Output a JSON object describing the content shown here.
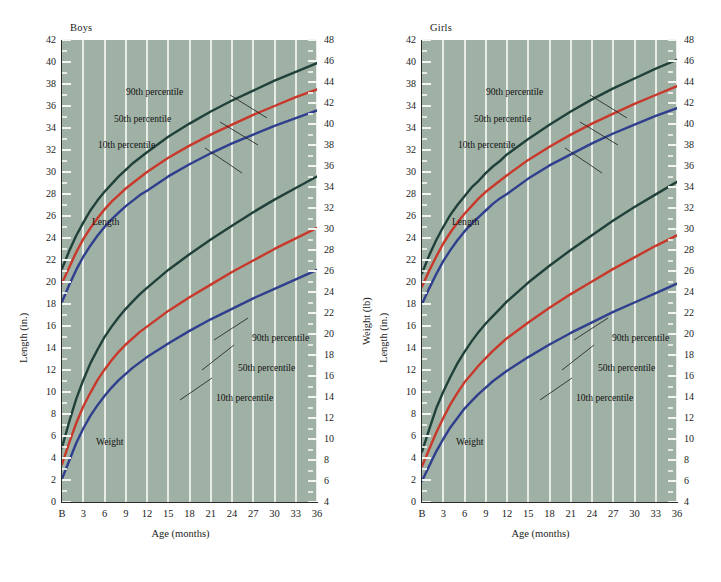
{
  "figure": {
    "background_color": "#ffffff",
    "plot_background_color": "#9fb0a4",
    "gridline_color": "#eef1ed"
  },
  "series_colors": {
    "p90": "#20413a",
    "p50": "#c8392c",
    "p10": "#2f3f8e"
  },
  "panels": [
    {
      "id": "boys",
      "title": "Boys",
      "x_axis": {
        "label": "Age (months)",
        "ticks": [
          "B",
          "3",
          "6",
          "9",
          "12",
          "15",
          "18",
          "21",
          "24",
          "27",
          "30",
          "33",
          "36"
        ],
        "values": [
          0,
          3,
          6,
          9,
          12,
          15,
          18,
          21,
          24,
          27,
          30,
          33,
          36
        ],
        "range": [
          0,
          36
        ]
      },
      "y_left": {
        "label": "Length (in.)",
        "range": [
          0,
          42
        ],
        "step": 2,
        "ticks": [
          "0",
          "2",
          "4",
          "6",
          "8",
          "10",
          "12",
          "14",
          "16",
          "18",
          "20",
          "22",
          "24",
          "26",
          "28",
          "30",
          "32",
          "34",
          "36",
          "38",
          "40",
          "42"
        ]
      },
      "y_right": {
        "label": "Weight (lb)",
        "range": [
          4,
          48
        ],
        "step": 2,
        "ticks": [
          "4",
          "6",
          "8",
          "10",
          "12",
          "14",
          "16",
          "18",
          "20",
          "22",
          "24",
          "26",
          "28",
          "30",
          "32",
          "34",
          "36",
          "38",
          "40",
          "42",
          "44",
          "46",
          "48"
        ]
      },
      "annotations": {
        "length_group": "Length",
        "weight_group": "Weight",
        "length_p90": "90th percentile",
        "length_p50": "50th percentile",
        "length_p10": "10th percentile",
        "weight_p90": "90th percentile",
        "weight_p50": "50th percentile",
        "weight_p10": "10th percentile"
      }
    },
    {
      "id": "girls",
      "title": "Girls",
      "x_axis": {
        "label": "Age (months)",
        "ticks": [
          "B",
          "3",
          "6",
          "9",
          "12",
          "15",
          "18",
          "21",
          "24",
          "27",
          "30",
          "33",
          "36"
        ],
        "values": [
          0,
          3,
          6,
          9,
          12,
          15,
          18,
          21,
          24,
          27,
          30,
          33,
          36
        ],
        "range": [
          0,
          36
        ]
      },
      "y_left": {
        "label": "Length (in.)",
        "range": [
          0,
          42
        ],
        "step": 2,
        "ticks": [
          "0",
          "2",
          "4",
          "6",
          "8",
          "10",
          "12",
          "14",
          "16",
          "18",
          "20",
          "22",
          "24",
          "26",
          "28",
          "30",
          "32",
          "34",
          "34",
          "38",
          "40",
          "42"
        ]
      },
      "y_right": {
        "label": "Weight (lb)",
        "range": [
          4,
          48
        ],
        "step": 2,
        "ticks": [
          "4",
          "6",
          "8",
          "10",
          "12",
          "14",
          "16",
          "18",
          "20",
          "22",
          "24",
          "26",
          "28",
          "30",
          "32",
          "34",
          "36",
          "38",
          "40",
          "42",
          "44",
          "46",
          "48"
        ]
      },
      "annotations": {
        "length_group": "Length",
        "weight_group": "Weight",
        "length_p90": "90th percentile",
        "length_p50": "50th percentile",
        "length_p10": "10th percentile",
        "weight_p90": "90th percentile",
        "weight_p50": "50th percentile",
        "weight_p10": "10th percentile"
      }
    }
  ],
  "chart_data": {
    "type": "line",
    "xlabel": "Age (months)",
    "x": [
      0,
      1,
      2,
      3,
      4,
      5,
      6,
      7,
      8,
      9,
      10,
      11,
      12,
      15,
      18,
      21,
      24,
      27,
      30,
      33,
      36
    ],
    "xlim": [
      0,
      36
    ],
    "grid": "vertical-only",
    "legend": "inline-annotations",
    "panels": [
      {
        "name": "Boys",
        "ylabel_left": "Length (in.)",
        "ylim_left": [
          0,
          42
        ],
        "ylabel_right": "Weight (lb)",
        "ylim_right": [
          4,
          48
        ],
        "length_in": [
          {
            "name": "90th percentile",
            "color": "#20413a",
            "values": [
              21.2,
              22.8,
              24.2,
              25.4,
              26.5,
              27.4,
              28.2,
              28.9,
              29.6,
              30.2,
              30.8,
              31.3,
              31.8,
              33.2,
              34.4,
              35.5,
              36.5,
              37.4,
              38.3,
              39.1,
              39.9
            ]
          },
          {
            "name": "50th percentile",
            "color": "#c8392c",
            "values": [
              19.9,
              21.3,
              22.7,
              23.9,
              24.9,
              25.8,
              26.6,
              27.3,
              27.9,
              28.5,
              29.0,
              29.5,
              30.0,
              31.3,
              32.4,
              33.4,
              34.3,
              35.2,
              36.0,
              36.8,
              37.5
            ]
          },
          {
            "name": "10th percentile",
            "color": "#2f3f8e",
            "values": [
              18.2,
              19.7,
              21.1,
              22.3,
              23.3,
              24.2,
              25.0,
              25.7,
              26.3,
              26.9,
              27.4,
              27.9,
              28.3,
              29.6,
              30.7,
              31.7,
              32.6,
              33.4,
              34.2,
              34.9,
              35.6
            ]
          }
        ],
        "weight_lb": [
          {
            "name": "90th percentile",
            "color": "#20413a",
            "values": [
              9.2,
              11.6,
              13.8,
              15.6,
              17.2,
              18.5,
              19.7,
              20.7,
              21.6,
              22.4,
              23.1,
              23.8,
              24.4,
              26.1,
              27.6,
              29.0,
              30.3,
              31.6,
              32.8,
              33.9,
              35.0
            ]
          },
          {
            "name": "50th percentile",
            "color": "#c8392c",
            "values": [
              7.6,
              9.6,
              11.5,
              13.1,
              14.4,
              15.6,
              16.6,
              17.5,
              18.3,
              19.0,
              19.6,
              20.2,
              20.7,
              22.2,
              23.5,
              24.7,
              25.9,
              27.0,
              28.1,
              29.1,
              30.1
            ]
          },
          {
            "name": "10th percentile",
            "color": "#2f3f8e",
            "values": [
              6.2,
              7.9,
              9.6,
              11.0,
              12.2,
              13.2,
              14.1,
              14.9,
              15.6,
              16.2,
              16.8,
              17.3,
              17.8,
              19.1,
              20.3,
              21.4,
              22.4,
              23.4,
              24.3,
              25.2,
              26.1
            ]
          }
        ]
      },
      {
        "name": "Girls",
        "ylabel_left": "Length (in.)",
        "ylim_left": [
          0,
          42
        ],
        "ylabel_right": "Weight (lb)",
        "ylim_right": [
          4,
          48
        ],
        "length_in": [
          {
            "name": "90th percentile",
            "color": "#20413a",
            "values": [
              20.8,
              22.4,
              23.8,
              25.0,
              26.1,
              27.0,
              27.8,
              28.6,
              29.2,
              29.9,
              30.5,
              31.0,
              31.6,
              33.0,
              34.3,
              35.5,
              36.6,
              37.6,
              38.5,
              39.4,
              40.2
            ]
          },
          {
            "name": "50th percentile",
            "color": "#c8392c",
            "values": [
              19.6,
              21.0,
              22.3,
              23.5,
              24.5,
              25.4,
              26.2,
              26.9,
              27.6,
              28.2,
              28.7,
              29.2,
              29.7,
              31.1,
              32.3,
              33.4,
              34.4,
              35.3,
              36.2,
              37.0,
              37.8
            ]
          },
          {
            "name": "10th percentile",
            "color": "#2f3f8e",
            "values": [
              18.0,
              19.4,
              20.7,
              21.9,
              22.9,
              23.8,
              24.6,
              25.3,
              25.9,
              26.5,
              27.1,
              27.6,
              28.0,
              29.4,
              30.6,
              31.6,
              32.6,
              33.5,
              34.3,
              35.1,
              35.8
            ]
          }
        ],
        "weight_lb": [
          {
            "name": "90th percentile",
            "color": "#20413a",
            "values": [
              8.8,
              10.9,
              12.9,
              14.5,
              15.9,
              17.2,
              18.3,
              19.3,
              20.2,
              21.0,
              21.7,
              22.4,
              23.1,
              24.9,
              26.5,
              28.0,
              29.4,
              30.8,
              32.1,
              33.3,
              34.5
            ]
          },
          {
            "name": "50th percentile",
            "color": "#c8392c",
            "values": [
              7.4,
              9.0,
              10.6,
              12.0,
              13.3,
              14.4,
              15.4,
              16.2,
              17.0,
              17.7,
              18.4,
              19.0,
              19.6,
              21.1,
              22.5,
              23.8,
              25.0,
              26.2,
              27.3,
              28.4,
              29.4
            ]
          },
          {
            "name": "10th percentile",
            "color": "#2f3f8e",
            "values": [
              6.0,
              7.4,
              8.8,
              10.0,
              11.1,
              12.0,
              12.9,
              13.6,
              14.3,
              14.9,
              15.5,
              16.0,
              16.5,
              17.8,
              19.0,
              20.1,
              21.1,
              22.1,
              23.0,
              23.9,
              24.8
            ]
          }
        ]
      }
    ]
  }
}
